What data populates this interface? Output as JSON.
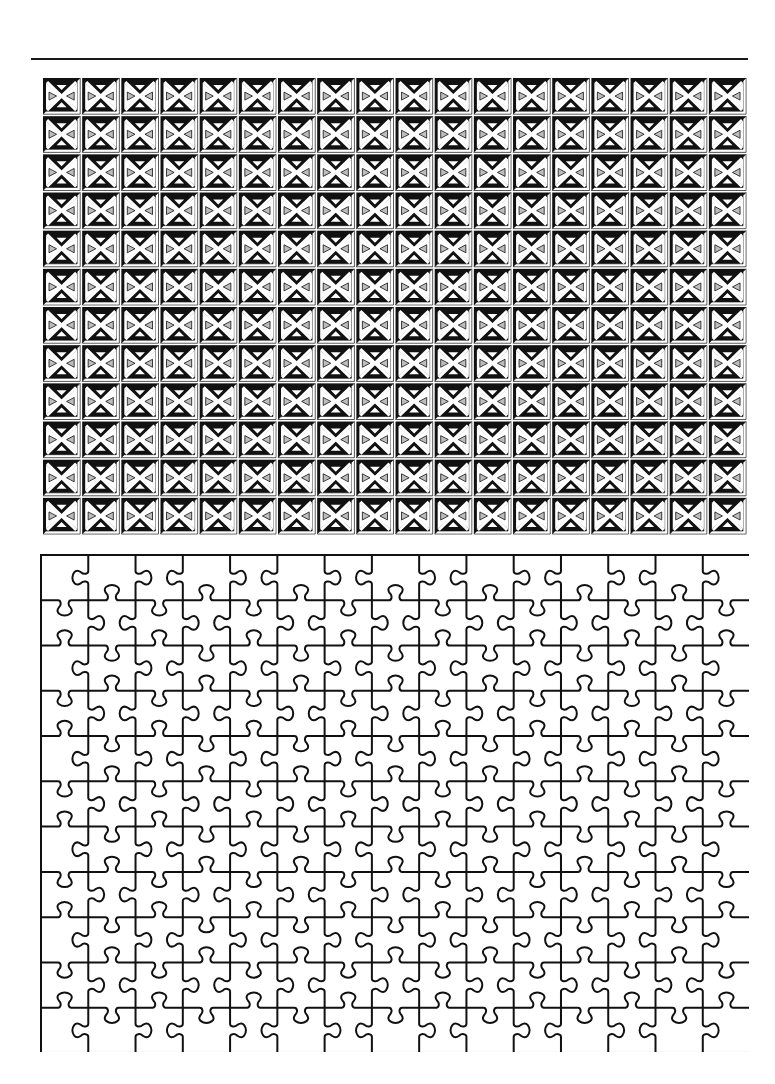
{
  "colors": {
    "ink": "#111111",
    "paper": "#ffffff",
    "tile_shade": "#bdbdbd"
  },
  "tile_grid": {
    "columns": 18,
    "rows": 12,
    "tile_width": 39.17,
    "tile_height": 38.17,
    "motif": "beveled-square-with-x-diagonals"
  },
  "puzzle": {
    "columns": 15,
    "rows": 11,
    "piece_width": 47.27,
    "piece_height": 45.27,
    "stroke_width": 2,
    "border": "rectangle"
  }
}
